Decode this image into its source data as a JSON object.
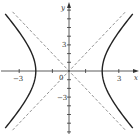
{
  "chart_data": {
    "type": "line",
    "title": "",
    "xlabel": "x",
    "ylabel": "y",
    "xlim": [
      -4.1,
      4.2
    ],
    "ylim": [
      -7.4,
      7.9
    ],
    "grid": false,
    "x_ticks": [
      -3,
      -1,
      1,
      3
    ],
    "x_tick_labels": [
      {
        "value": -3,
        "label": "−3"
      },
      {
        "value": 3,
        "label": "3"
      }
    ],
    "y_ticks": [
      -7,
      -6,
      -5,
      -4,
      -3,
      -2,
      -1,
      1,
      2,
      3,
      4,
      5,
      6,
      7
    ],
    "y_tick_labels": [
      {
        "value": 3,
        "label": "3"
      },
      {
        "value": -3,
        "label": "−3"
      }
    ],
    "origin_label": "0",
    "vertices": [
      [
        -2,
        0
      ],
      [
        2,
        0
      ]
    ],
    "series": [
      {
        "name": "hyperbola",
        "style": "solid",
        "equation": "x^2/4 - y^2/16 = 1"
      },
      {
        "name": "asymptote y=2x",
        "style": "dashed",
        "points": [
          [
            -3.4,
            -6.8
          ],
          [
            3.4,
            6.8
          ]
        ]
      },
      {
        "name": "asymptote y=-2x",
        "style": "dashed",
        "points": [
          [
            -3.4,
            6.8
          ],
          [
            3.4,
            -6.8
          ]
        ]
      }
    ],
    "colors": {
      "curve": "#222222",
      "asymptote": "#777777",
      "axis": "#333333"
    }
  },
  "labels": {
    "x_axis": "x",
    "y_axis": "y",
    "origin": "0",
    "x_neg3": "−3",
    "x_pos3": "3",
    "y_pos3": "3",
    "y_neg3": "−3"
  }
}
